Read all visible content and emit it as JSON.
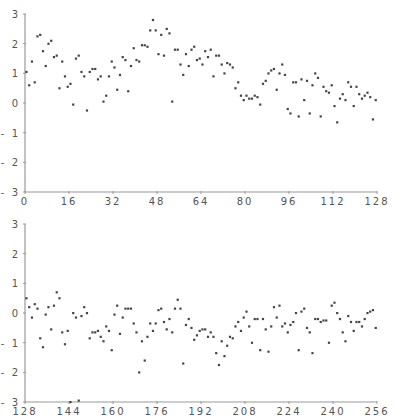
{
  "chart_data": [
    {
      "type": "scatter",
      "title": "",
      "xlabel": "",
      "ylabel": "",
      "xlim": [
        0,
        128
      ],
      "ylim": [
        -3,
        3
      ],
      "grid": false,
      "legend": null,
      "xticks": [
        0,
        16,
        32,
        48,
        64,
        80,
        96,
        112,
        128
      ],
      "yticks": [
        3,
        2,
        1,
        0,
        -1,
        -2,
        -3
      ],
      "xtick_labels": [
        "0",
        "16",
        "32",
        "48",
        "64",
        "80",
        "96",
        "112",
        "128"
      ],
      "ytick_labels": [
        "3",
        "2",
        "1",
        "0",
        "-1",
        "-2",
        "-3"
      ],
      "x_start": 0,
      "values": [
        1.05,
        0.6,
        1.4,
        0.7,
        2.25,
        2.3,
        1.75,
        1.25,
        2.0,
        2.1,
        1.55,
        1.6,
        0.5,
        1.4,
        0.9,
        0.55,
        0.65,
        -0.05,
        1.5,
        1.6,
        1.05,
        0.9,
        -0.25,
        1.05,
        1.15,
        1.15,
        0.8,
        0.9,
        0.05,
        0.25,
        0.9,
        1.4,
        1.2,
        0.45,
        0.95,
        1.55,
        1.45,
        0.4,
        1.25,
        1.85,
        1.45,
        1.4,
        1.95,
        1.95,
        1.9,
        2.45,
        2.8,
        2.45,
        1.65,
        2.3,
        1.6,
        2.5,
        2.35,
        0.05,
        1.8,
        1.8,
        1.3,
        0.95,
        1.65,
        1.25,
        1.8,
        1.9,
        1.45,
        1.5,
        1.3,
        1.75,
        1.55,
        1.8,
        0.9,
        1.6,
        1.6,
        1.3,
        1.0,
        1.35,
        1.3,
        1.2,
        0.5,
        0.7,
        0.25,
        0.1,
        0.25,
        0.15,
        0.15,
        0.25,
        0.2,
        -0.05,
        0.65,
        0.75,
        1.0,
        1.1,
        1.15,
        0.45,
        1.0,
        1.3,
        0.95,
        -0.2,
        -0.35,
        0.7,
        0.7,
        -0.45,
        0.8,
        0.1,
        0.75,
        -0.35,
        0.6,
        1.0,
        0.85,
        -0.45,
        0.55,
        0.4,
        0.35,
        0.6,
        -0.1,
        -0.65,
        0.15,
        0.3,
        0.1,
        0.7,
        0.55,
        -0.1,
        0.55,
        0.3,
        0.15,
        0.25,
        0.35,
        0.2,
        -0.55,
        0.1
      ]
    },
    {
      "type": "scatter",
      "title": "",
      "xlabel": "",
      "ylabel": "",
      "xlim": [
        128,
        256
      ],
      "ylim": [
        -3,
        3
      ],
      "grid": false,
      "legend": null,
      "xticks": [
        128,
        144,
        160,
        176,
        192,
        208,
        224,
        240,
        256
      ],
      "yticks": [
        3,
        2,
        1,
        0,
        -1,
        -2,
        -3
      ],
      "xtick_labels": [
        "128",
        "144",
        "160",
        "176",
        "192",
        "208",
        "224",
        "240",
        "256"
      ],
      "ytick_labels": [
        "3",
        "2",
        "1",
        "0",
        "-1",
        "-2",
        "-3"
      ],
      "x_start": 128,
      "values": [
        0.5,
        0.2,
        -0.15,
        0.3,
        0.15,
        -0.85,
        -1.15,
        -0.05,
        0.2,
        -0.55,
        0.25,
        0.7,
        0.5,
        -0.65,
        -1.05,
        -0.6,
        -3.0,
        0.0,
        -0.15,
        -2.95,
        -0.1,
        0.2,
        0.0,
        -0.85,
        -0.65,
        -0.65,
        -0.6,
        -0.8,
        -0.95,
        -0.45,
        -0.6,
        -1.25,
        -0.05,
        0.25,
        -0.7,
        -0.15,
        0.15,
        0.15,
        0.15,
        -0.35,
        -0.65,
        -2.0,
        -0.95,
        -1.6,
        -0.8,
        -0.35,
        -0.6,
        -0.35,
        0.1,
        0.15,
        -0.3,
        -0.55,
        -0.2,
        -0.65,
        0.15,
        0.45,
        0.15,
        -1.7,
        -0.4,
        -0.2,
        -0.5,
        -0.9,
        -0.75,
        -0.6,
        -0.55,
        -0.55,
        -0.8,
        -0.65,
        -0.8,
        -1.35,
        -1.75,
        -0.95,
        -1.45,
        -1.1,
        -0.8,
        -0.85,
        -0.45,
        -0.3,
        -0.6,
        -0.15,
        0.05,
        -0.45,
        -1.0,
        -0.2,
        -0.2,
        -1.25,
        -0.2,
        -0.55,
        -1.3,
        -0.45,
        0.2,
        -0.15,
        0.25,
        -0.45,
        -0.35,
        -0.65,
        -0.4,
        -0.3,
        0.0,
        -1.25,
        0.05,
        0.15,
        -0.5,
        -0.65,
        -1.35,
        -0.2,
        -0.2,
        -0.3,
        -0.25,
        -0.25,
        -1.0,
        0.25,
        0.35,
        0.0,
        -0.2,
        -0.65,
        -0.95,
        -0.1,
        -0.3,
        -0.6,
        -0.3,
        -0.3,
        -0.45,
        -0.2,
        0.0,
        0.05,
        0.1,
        -0.5
      ]
    }
  ],
  "panels": [
    {
      "name": "top-panel",
      "plot_box": {
        "left": 25,
        "right": 377,
        "top": 14,
        "bottom": 192
      }
    },
    {
      "name": "bottom-panel",
      "plot_box": {
        "left": 25,
        "right": 377,
        "top": 224,
        "bottom": 402
      }
    }
  ],
  "style": {
    "point_color": "#444444",
    "axis_color": "#9a9a9a",
    "label_color": "#555555"
  }
}
